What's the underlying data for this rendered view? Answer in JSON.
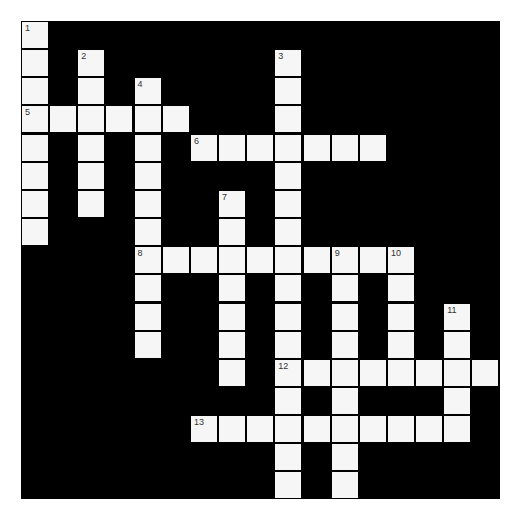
{
  "puzzle": {
    "rows": 17,
    "cols": 17,
    "colors": {
      "block": "#000000",
      "cell": "#f6f6f6",
      "number": "#333333",
      "background": "#ffffff"
    },
    "entries": [
      {
        "number": "1",
        "direction": "down",
        "row": 0,
        "col": 0,
        "length": 8
      },
      {
        "number": "2",
        "direction": "down",
        "row": 1,
        "col": 2,
        "length": 6
      },
      {
        "number": "3",
        "direction": "down",
        "row": 1,
        "col": 9,
        "length": 16
      },
      {
        "number": "4",
        "direction": "down",
        "row": 2,
        "col": 4,
        "length": 10
      },
      {
        "number": "5",
        "direction": "across",
        "row": 3,
        "col": 0,
        "length": 6
      },
      {
        "number": "6",
        "direction": "across",
        "row": 4,
        "col": 6,
        "length": 7
      },
      {
        "number": "7",
        "direction": "down",
        "row": 6,
        "col": 7,
        "length": 7
      },
      {
        "number": "8",
        "direction": "across",
        "row": 8,
        "col": 4,
        "length": 10
      },
      {
        "number": "9",
        "direction": "down",
        "row": 8,
        "col": 11,
        "length": 9
      },
      {
        "number": "10",
        "direction": "down",
        "row": 8,
        "col": 13,
        "length": 5
      },
      {
        "number": "11",
        "direction": "down",
        "row": 10,
        "col": 15,
        "length": 5
      },
      {
        "number": "12",
        "direction": "across",
        "row": 12,
        "col": 9,
        "length": 8
      },
      {
        "number": "13",
        "direction": "across",
        "row": 14,
        "col": 6,
        "length": 10
      }
    ]
  }
}
